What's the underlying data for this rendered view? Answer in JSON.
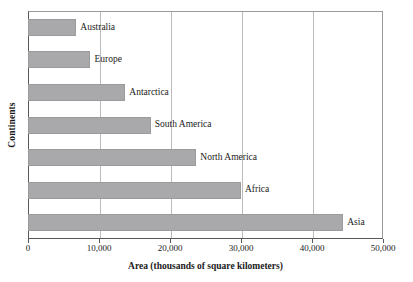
{
  "chart_data": {
    "type": "bar",
    "orientation": "horizontal",
    "title": "",
    "xlabel": "Area (thousands of square kilometers)",
    "ylabel": "Continents",
    "categories": [
      "Australia",
      "Europe",
      "Antarctica",
      "South America",
      "North America",
      "Africa",
      "Asia"
    ],
    "values": [
      6800,
      8800,
      13700,
      17300,
      23700,
      30000,
      44400
    ],
    "xlim": [
      0,
      50000
    ],
    "xticks": [
      0,
      10000,
      20000,
      30000,
      40000,
      50000
    ],
    "xtick_labels": [
      "0",
      "10,000",
      "20,000",
      "30,000",
      "40,000",
      "50,000"
    ],
    "grid": "vertical",
    "legend": "none",
    "bar_color": "#a9a9ab",
    "axis_color": "#58585a",
    "gridline_color": "#bcbcbe",
    "data_labels_position": "outside-end",
    "bars": [
      {
        "label": "Australia",
        "value": 6800
      },
      {
        "label": "Europe",
        "value": 8800
      },
      {
        "label": "Antarctica",
        "value": 13700
      },
      {
        "label": "South America",
        "value": 17300
      },
      {
        "label": "North America",
        "value": 23700
      },
      {
        "label": "Africa",
        "value": 30000
      },
      {
        "label": "Asia",
        "value": 44400
      }
    ]
  }
}
